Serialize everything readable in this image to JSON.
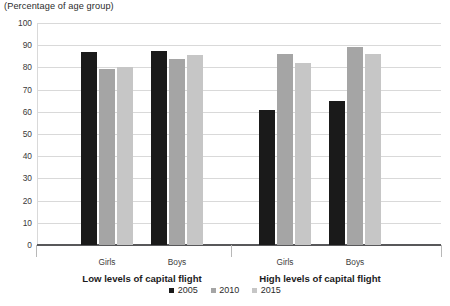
{
  "chart_data": {
    "type": "bar",
    "title": "(Percentage of age group)",
    "xlabel": "",
    "ylabel": "(Percentage of age group)",
    "ylim": [
      0,
      100
    ],
    "ytick_step": 10,
    "yticks": [
      "100",
      "90",
      "80",
      "70",
      "60",
      "50",
      "40",
      "30",
      "20",
      "10",
      "0"
    ],
    "grid": true,
    "legend_position": "bottom-center",
    "categories": [
      "Girls",
      "Boys",
      "Girls",
      "Boys"
    ],
    "groups": [
      {
        "label": "Low levels of capital flight",
        "categories": [
          "Girls",
          "Boys"
        ]
      },
      {
        "label": "High levels of capital flight",
        "categories": [
          "Girls",
          "Boys"
        ]
      }
    ],
    "series": [
      {
        "name": "2005",
        "color": "#1a1a1a",
        "values": [
          87,
          87.5,
          61,
          65
        ]
      },
      {
        "name": "2010",
        "color": "#a5a5a5",
        "values": [
          79.5,
          84,
          86,
          89
        ]
      },
      {
        "name": "2015",
        "color": "#c6c6c6",
        "values": [
          80,
          85.5,
          82,
          86
        ]
      }
    ]
  },
  "legend": {
    "items": [
      {
        "label": "2005",
        "color": "#1a1a1a"
      },
      {
        "label": "2010",
        "color": "#a5a5a5"
      },
      {
        "label": "2015",
        "color": "#c6c6c6"
      }
    ]
  },
  "colors": {
    "series_2005": "#1a1a1a",
    "series_2010": "#a5a5a5",
    "series_2015": "#c6c6c6",
    "gridline": "#d9d9d9",
    "axis": "#58585a",
    "text": "#231f20",
    "background": "#ffffff"
  }
}
